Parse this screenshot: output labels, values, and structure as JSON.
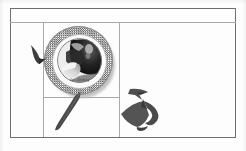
{
  "page": {
    "background_color": "#fdfdfd",
    "rule_color": "#8e8e8e"
  },
  "table": {
    "name": "scanned-grid",
    "header_row_label": "",
    "cells": [
      {
        "id": "header",
        "label": ""
      },
      {
        "id": "left-upper",
        "label": ""
      },
      {
        "id": "left-lower",
        "label": ""
      },
      {
        "id": "center-upper",
        "label": ""
      },
      {
        "id": "center-lower",
        "label": ""
      },
      {
        "id": "right",
        "label": ""
      }
    ]
  },
  "plate": {
    "name": "halftone-plate-illustration",
    "caption": "abc. Abcdefg",
    "rim_pattern": "halftone-checker",
    "rim_color": "#5f5f5f",
    "photo_description": "grayscale-photo-detail"
  },
  "shapes": {
    "pointer_wedge": {
      "name": "pointer-wedge-icon",
      "color": "#3f3f3f"
    },
    "knife_blade": {
      "name": "knife-blade-shape",
      "color": "#4a4a4a"
    },
    "silhouette": {
      "name": "dark-angular-silhouette",
      "color": "#4f4f4f"
    }
  }
}
